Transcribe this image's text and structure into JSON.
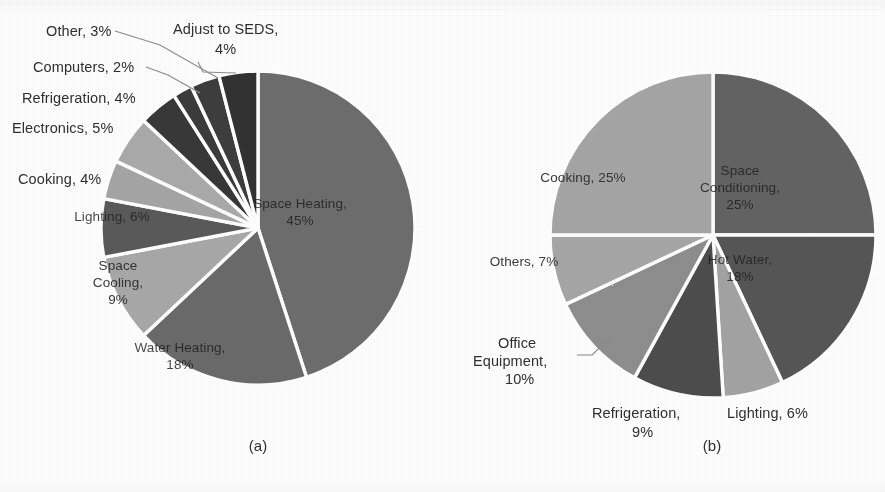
{
  "figure": {
    "background_color": "#fefefe",
    "width": 885,
    "height": 492
  },
  "panels": [
    {
      "id": "a",
      "caption": "(a)",
      "center_x": 258,
      "center_y": 228,
      "radius": 157,
      "start_angle_deg": 0
    },
    {
      "id": "b",
      "caption": "(b)",
      "center_x": 713,
      "center_y": 235,
      "radius": 163,
      "start_angle_deg": 0
    }
  ],
  "chart_data": [
    {
      "type": "pie",
      "title": "(a)",
      "legend_position": "labels-on-and-around-slices",
      "start_angle": 0,
      "direction": "clockwise",
      "categories": [
        "Space Heating",
        "Water Heating",
        "Space Cooling",
        "Lighting",
        "Cooking",
        "Electronics",
        "Refrigeration",
        "Computers",
        "Other",
        "Adjust to SEDS"
      ],
      "values": [
        45,
        18,
        9,
        6,
        4,
        5,
        4,
        2,
        3,
        4
      ],
      "unit": "%",
      "labels": [
        "Space Heating, 45%",
        "Water Heating, 18%",
        "Space Cooling, 9%",
        "Lighting, 6%",
        "Cooking, 4%",
        "Electronics, 5%",
        "Refrigeration, 4%",
        "Computers, 2%",
        "Other, 3%",
        "Adjust to SEDS, 4%"
      ],
      "colors": [
        "#6d6d6d",
        "#6a6a6a",
        "#a8a8a8",
        "#5a5a5a",
        "#a5a5a5",
        "#aaaaaa",
        "#373737",
        "#3a3a3a",
        "#3c3c3c",
        "#303030"
      ]
    },
    {
      "type": "pie",
      "title": "(b)",
      "legend_position": "labels-on-and-around-slices",
      "start_angle": 0,
      "direction": "clockwise",
      "categories": [
        "Space Conditioning",
        "Hot Water",
        "Lighting",
        "Refrigeration",
        "Office Equipment",
        "Others",
        "Cooking"
      ],
      "values": [
        25,
        18,
        6,
        9,
        10,
        7,
        25
      ],
      "unit": "%",
      "labels": [
        "Space Conditioning, 25%",
        "Hot Water, 18%",
        "Lighting, 6%",
        "Refrigeration, 9%",
        "Office Equipment, 10%",
        "Others, 7%",
        "Cooking, 25%"
      ],
      "colors": [
        "#636363",
        "#565656",
        "#a3a3a3",
        "#4d4d4d",
        "#8e8e8e",
        "#a6a6a6",
        "#a5a5a5"
      ]
    }
  ],
  "panel_a": {
    "caption": "(a)",
    "outside_labels": [
      {
        "text": "Other, 3%",
        "x": 46,
        "y": 22,
        "align": "left"
      },
      {
        "text": "Adjust to SEDS,",
        "x": 173,
        "y": 20,
        "align": "left"
      },
      {
        "text": "4%",
        "x": 215,
        "y": 40,
        "align": "left"
      },
      {
        "text": "Computers, 2%",
        "x": 33,
        "y": 58,
        "align": "left"
      },
      {
        "text": "Refrigeration, 4%",
        "x": 22,
        "y": 89,
        "align": "left"
      },
      {
        "text": "Electronics, 5%",
        "x": 12,
        "y": 119,
        "align": "left"
      },
      {
        "text": "Cooking, 4%",
        "x": 18,
        "y": 170,
        "align": "left"
      }
    ],
    "inside_labels": [
      {
        "text": "Space Heating,\n45%",
        "x": 300,
        "y": 196,
        "tone": "dark"
      },
      {
        "text": "Water Heating,\n18%",
        "x": 180,
        "y": 340,
        "tone": "dark"
      },
      {
        "text": "Space\nCooling,\n9%",
        "x": 118,
        "y": 258,
        "tone": "light"
      },
      {
        "text": "Lighting, 6%",
        "x": 112,
        "y": 209,
        "tone": "dark"
      }
    ],
    "leader_lines": [
      {
        "x1": 115,
        "y1": 31,
        "x2": 160,
        "y2": 45,
        "x3": 218,
        "y3": 78
      },
      {
        "x1": 146,
        "y1": 67,
        "x2": 168,
        "y2": 75,
        "x3": 200,
        "y3": 93
      },
      {
        "x1": 198,
        "y1": 62,
        "x2": 203,
        "y2": 72,
        "x3": 236,
        "y3": 73
      }
    ]
  },
  "panel_b": {
    "caption": "(b)",
    "outside_labels": [
      {
        "text": "Office",
        "x": 498,
        "y": 334,
        "align": "left"
      },
      {
        "text": "Equipment,",
        "x": 473,
        "y": 352,
        "align": "left"
      },
      {
        "text": "10%",
        "x": 505,
        "y": 370,
        "align": "left"
      },
      {
        "text": "Refrigeration,",
        "x": 592,
        "y": 404,
        "align": "left"
      },
      {
        "text": "9%",
        "x": 632,
        "y": 423,
        "align": "left"
      },
      {
        "text": "Lighting, 6%",
        "x": 727,
        "y": 404,
        "align": "left"
      }
    ],
    "inside_labels": [
      {
        "text": "Cooking, 25%",
        "x": 583,
        "y": 170,
        "tone": "light"
      },
      {
        "text": "Space\nConditioning,\n25%",
        "x": 740,
        "y": 163,
        "tone": "dark"
      },
      {
        "text": "Others, 7%",
        "x": 524,
        "y": 254,
        "tone": "light"
      },
      {
        "text": "Hot Water,\n18%",
        "x": 740,
        "y": 252,
        "tone": "dark"
      }
    ],
    "leader_lines": [
      {
        "x1": 577,
        "y1": 355,
        "x2": 592,
        "y2": 355,
        "x3": 611,
        "y3": 337
      }
    ]
  }
}
